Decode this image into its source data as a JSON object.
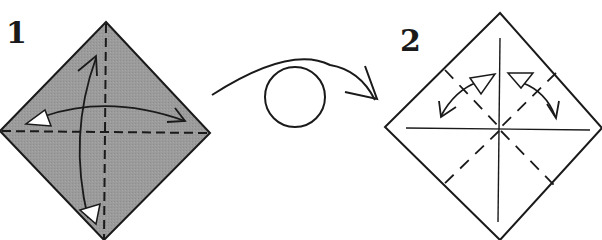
{
  "diagram": {
    "type": "origami-instructions",
    "steps": [
      {
        "number": "1",
        "paper": "square diamond, colored side up",
        "fill_color": "#9a9a9a",
        "creases": [
          "vertical valley fold (dashed)",
          "horizontal valley fold (dashed)"
        ],
        "arrows": [
          "fold-and-unfold left-right",
          "fold-and-unfold top-bottom"
        ]
      },
      {
        "number": "2",
        "paper": "square diamond, white side up",
        "fill_color": "#ffffff",
        "creases": [
          "vertical crease",
          "horizontal crease",
          "diagonal valley folds (dashed)"
        ],
        "arrows": [
          "fold-and-unfold upper-left",
          "fold-and-unfold upper-right"
        ]
      }
    ],
    "transition": {
      "symbol": "turn-over",
      "description": "turn paper over"
    },
    "colors": {
      "line": "#1a1a1a",
      "paper_colored": "#9a9a9a",
      "paper_white": "#ffffff"
    }
  }
}
